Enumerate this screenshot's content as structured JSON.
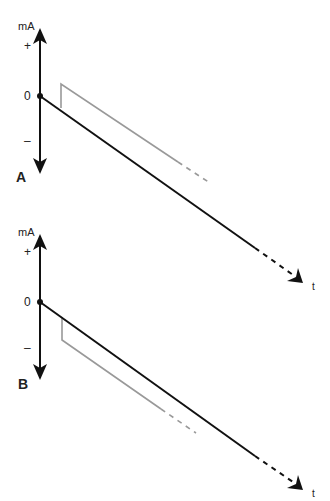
{
  "panels": [
    {
      "label": "A",
      "y_axis_label": "mA",
      "plus_label": "+",
      "zero_label": "0",
      "minus_label": "–",
      "x_axis_label": "t"
    },
    {
      "label": "B",
      "y_axis_label": "mA",
      "plus_label": "+",
      "zero_label": "0",
      "minus_label": "–",
      "x_axis_label": "t"
    }
  ],
  "colors": {
    "axis": "#111111",
    "main_line": "#111111",
    "offset_line": "#999999"
  }
}
